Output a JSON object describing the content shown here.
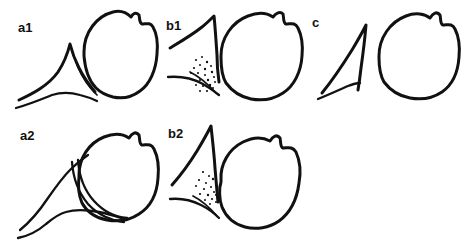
{
  "figure": {
    "background_color": "#ffffff",
    "line_color": "#111111",
    "width": 467,
    "height": 250,
    "panel_count": 5
  },
  "panels": [
    {
      "id": "a1",
      "label": "a1",
      "label_x": 18,
      "label_y": 32,
      "row": 1,
      "column": 1,
      "description": "Acetabular roof with pointed bony rim and rounded femoral head, normal configuration",
      "features": [
        "bony-acetabular-roof",
        "femoral-head",
        "acetabular-labrum-line"
      ]
    },
    {
      "id": "b1",
      "label": "b1",
      "label_x": 166,
      "label_y": 30,
      "row": 1,
      "column": 2,
      "description": "Acetabular roof with stippled cartilaginous region and rounded femoral head",
      "features": [
        "bony-acetabular-roof",
        "stippled-cartilage",
        "femoral-head"
      ]
    },
    {
      "id": "c",
      "label": "c",
      "label_x": 312,
      "label_y": 27,
      "row": 1,
      "column": 3,
      "description": "Separated curved acetabular roof and free-standing femoral head",
      "features": [
        "curved-acetabular-roof",
        "femoral-head"
      ]
    },
    {
      "id": "a2",
      "label": "a2",
      "label_x": 20,
      "label_y": 140,
      "row": 2,
      "column": 1,
      "description": "Acetabular roof with double-line labral crescent overlying femoral head",
      "features": [
        "bony-acetabular-roof",
        "labral-crescent-double-line",
        "femoral-head"
      ]
    },
    {
      "id": "b2",
      "label": "b2",
      "label_x": 168,
      "label_y": 138,
      "row": 2,
      "column": 2,
      "description": "Steep acetabular roof with stippled cartilage and laterally displaced femoral head",
      "features": [
        "steep-acetabular-roof",
        "stippled-cartilage",
        "femoral-head"
      ]
    }
  ],
  "stipple": {
    "b1_dots": [
      [
        196,
        60
      ],
      [
        202,
        57
      ],
      [
        207,
        62
      ],
      [
        200,
        65
      ],
      [
        194,
        68
      ],
      [
        205,
        69
      ],
      [
        211,
        66
      ],
      [
        198,
        73
      ],
      [
        205,
        75
      ],
      [
        212,
        72
      ],
      [
        191,
        73
      ],
      [
        200,
        80
      ],
      [
        208,
        80
      ],
      [
        214,
        77
      ],
      [
        196,
        85
      ],
      [
        203,
        86
      ],
      [
        210,
        85
      ],
      [
        215,
        82
      ],
      [
        207,
        91
      ],
      [
        213,
        88
      ],
      [
        200,
        91
      ]
    ],
    "b2_dots": [
      [
        203,
        172
      ],
      [
        209,
        176
      ],
      [
        199,
        180
      ],
      [
        206,
        183
      ],
      [
        213,
        179
      ],
      [
        196,
        186
      ],
      [
        204,
        189
      ],
      [
        211,
        187
      ],
      [
        200,
        194
      ],
      [
        208,
        195
      ],
      [
        214,
        192
      ],
      [
        205,
        200
      ],
      [
        212,
        199
      ],
      [
        216,
        195
      ],
      [
        210,
        204
      ],
      [
        216,
        202
      ]
    ]
  }
}
